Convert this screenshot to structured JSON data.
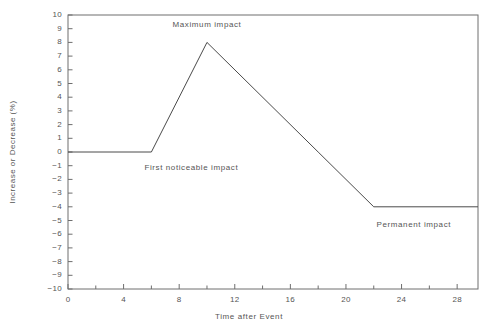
{
  "chart_data": {
    "type": "line",
    "title": "",
    "xlabel": "Time after Event",
    "ylabel": "Increase or Decrease (%)",
    "xlim": [
      0,
      29.5
    ],
    "ylim": [
      -10,
      10
    ],
    "grid": false,
    "legend": null,
    "x": [
      0,
      6,
      10,
      18,
      22,
      29.5
    ],
    "y": [
      0,
      0,
      8,
      0,
      -4,
      -4
    ],
    "series": [
      {
        "name": "Impact over time",
        "x": [
          0,
          6,
          10,
          18,
          22,
          29.5
        ],
        "values": [
          0,
          0,
          8,
          0,
          -4,
          -4
        ],
        "color": "#4a4a4a"
      }
    ],
    "x_ticks_major": [
      0,
      4,
      8,
      12,
      16,
      20,
      24,
      28
    ],
    "x_ticks_minor": [
      2,
      6,
      10,
      14,
      18,
      22,
      26
    ],
    "x_tick_labels": [
      "0",
      "4",
      "8",
      "12",
      "16",
      "20",
      "24",
      "28"
    ],
    "y_ticks": [
      10,
      9,
      8,
      7,
      6,
      5,
      4,
      3,
      2,
      1,
      0,
      -1,
      -2,
      -3,
      -4,
      -5,
      -6,
      -7,
      -8,
      -9,
      -10
    ],
    "y_tick_labels": [
      "10",
      "9",
      "8",
      "7",
      "6",
      "5",
      "4",
      "3",
      "2",
      "1",
      "0",
      "−1",
      "−2",
      "−3",
      "−4",
      "−5",
      "−6",
      "−7",
      "−8",
      "−9",
      "−10"
    ],
    "annotations": [
      {
        "text": "Maximum impact",
        "x": 10,
        "y": 9.3,
        "anchor": "middle"
      },
      {
        "text": "First noticeable impact",
        "x": 5.5,
        "y": -1.15,
        "anchor": "start"
      },
      {
        "text": "Permanent impact",
        "x": 22.2,
        "y": -5.3,
        "anchor": "start"
      }
    ],
    "colors": {
      "line": "#4a4a4a",
      "axis": "#6e6e6e",
      "text": "#555555",
      "background": "#ffffff"
    }
  }
}
